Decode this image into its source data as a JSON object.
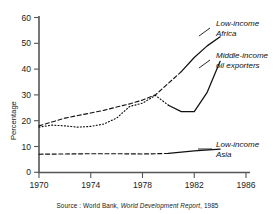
{
  "chart_data": {
    "type": "line",
    "title": "",
    "xlabel": "",
    "ylabel": "Percentage",
    "xlim": [
      1970,
      1986
    ],
    "ylim": [
      0,
      60
    ],
    "xticks": [
      "1970",
      "1974",
      "1978",
      "1982",
      "1986"
    ],
    "xtick_values": [
      1970,
      1974,
      1978,
      1982,
      1986
    ],
    "yticks": [
      "0",
      "10",
      "20",
      "30",
      "40",
      "50",
      "60"
    ],
    "ytick_values": [
      0,
      10,
      20,
      30,
      40,
      50,
      60
    ],
    "grid": false,
    "legend_position": "right-inline-labels",
    "series": [
      {
        "name": "Low-income Africa",
        "label_line1": "Low-income",
        "label_line2": "Africa",
        "style": "dashed-then-solid",
        "color": "#111111",
        "x": [
          1970,
          1971,
          1972,
          1973,
          1974,
          1975,
          1976,
          1977,
          1978,
          1979,
          1980,
          1981,
          1982,
          1983,
          1984
        ],
        "values": [
          18.0,
          19.5,
          21.0,
          22.0,
          23.0,
          24.0,
          25.3,
          26.5,
          28.0,
          30.0,
          34.5,
          39.0,
          44.5,
          49.0,
          52.5
        ],
        "solid_from_x": 1981
      },
      {
        "name": "Middle-income oil exporters",
        "label_line1": "Middle-income",
        "label_line2": "oil exporters",
        "style": "dotted-then-solid",
        "color": "#111111",
        "x": [
          1970,
          1971,
          1972,
          1973,
          1974,
          1975,
          1976,
          1977,
          1978,
          1979,
          1980,
          1981,
          1982,
          1983,
          1984
        ],
        "values": [
          17.5,
          18.3,
          18.0,
          17.5,
          17.8,
          18.7,
          21.0,
          25.5,
          26.8,
          29.8,
          26.0,
          23.5,
          23.5,
          31.0,
          43.0
        ],
        "solid_from_x": 1980
      },
      {
        "name": "Low-income Asia",
        "label_line1": "Low-income",
        "label_line2": "Asia",
        "style": "dashed-then-solid",
        "color": "#111111",
        "x": [
          1970,
          1972,
          1974,
          1976,
          1978,
          1980,
          1982,
          1984
        ],
        "values": [
          7.0,
          7.1,
          7.2,
          7.2,
          7.1,
          7.3,
          8.3,
          9.0
        ],
        "solid_from_x": 1980
      }
    ]
  },
  "axes": {
    "y_axis_title": "Percentage",
    "y_tick_labels": [
      "60",
      "50",
      "40",
      "30",
      "20",
      "10",
      "0"
    ],
    "x_tick_labels": [
      "1970",
      "1974",
      "1978",
      "1982",
      "1986"
    ]
  },
  "annotations": {
    "africa_line1": "Low-income",
    "africa_line2": "Africa",
    "oil_line1": "Middle-income",
    "oil_line2": "oil exporters",
    "asia_line1": "Low-income",
    "asia_line2": "Asia"
  },
  "source": {
    "prefix": "Source : World Bank,",
    "report": "World Development Report",
    "year": ", 1985"
  },
  "colors": {
    "ink": "#111111",
    "axis": "#4d4d4d",
    "background": "#ffffff"
  }
}
